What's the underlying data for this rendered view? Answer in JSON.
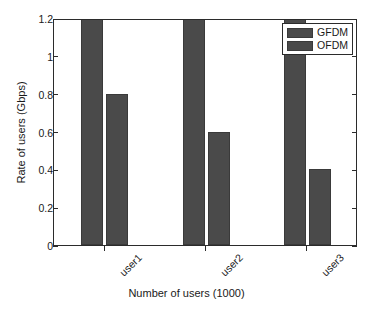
{
  "chart_data": {
    "type": "bar",
    "title": "",
    "categories": [
      "user1",
      "user2",
      "user3"
    ],
    "series": [
      {
        "name": "GFDM",
        "values": [
          1.28,
          1.26,
          1.27
        ],
        "clipped": true
      },
      {
        "name": "OFDM",
        "values": [
          0.8,
          0.6,
          0.4
        ],
        "clipped": false
      }
    ],
    "xlabel": "Number of users (1000)",
    "ylabel": "Rate of users (Gbps)",
    "ylim": [
      0,
      1.2
    ],
    "yticks": [
      "0",
      "0.2",
      "0.4",
      "0.6",
      "0.8",
      "1",
      "1.2"
    ],
    "ytick_values": [
      0,
      0.2,
      0.4,
      0.6,
      0.8,
      1.0,
      1.2
    ],
    "grid": false,
    "legend_position": "top-right",
    "bar_color": "#4a4a4a",
    "axis_color": "#2b2b2b",
    "background": "#ffffff",
    "note": "GFDM bars exceed the 1.2 axis maximum and are clipped at the top of the plot box."
  },
  "legend": {
    "entries": [
      {
        "label": "GFDM",
        "color": "#4a4a4a"
      },
      {
        "label": "OFDM",
        "color": "#4a4a4a"
      }
    ]
  }
}
